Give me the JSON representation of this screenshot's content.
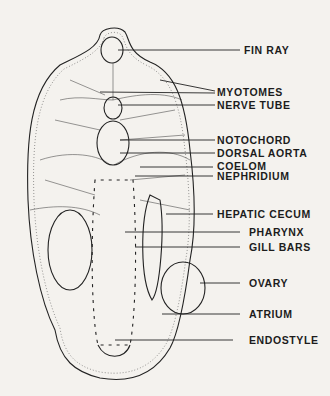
{
  "labels": [
    {
      "id": "fin-ray",
      "text": "FIN RAY"
    },
    {
      "id": "myotomes",
      "text": "MYOTOMES"
    },
    {
      "id": "nerve-tube",
      "text": "NERVE TUBE"
    },
    {
      "id": "notochord",
      "text": "NOTOCHORD"
    },
    {
      "id": "dorsal-aorta",
      "text": "DORSAL AORTA"
    },
    {
      "id": "coelom",
      "text": "COELOM"
    },
    {
      "id": "nephridium",
      "text": "NEPHRIDIUM"
    },
    {
      "id": "hepatic-cecum",
      "text": "HEPATIC CECUM"
    },
    {
      "id": "pharynx",
      "text": "PHARYNX"
    },
    {
      "id": "gill-bars",
      "text": "GILL BARS"
    },
    {
      "id": "ovary",
      "text": "OVARY"
    },
    {
      "id": "atrium",
      "text": "ATRIUM"
    },
    {
      "id": "endostyle",
      "text": "ENDOSTYLE"
    }
  ]
}
